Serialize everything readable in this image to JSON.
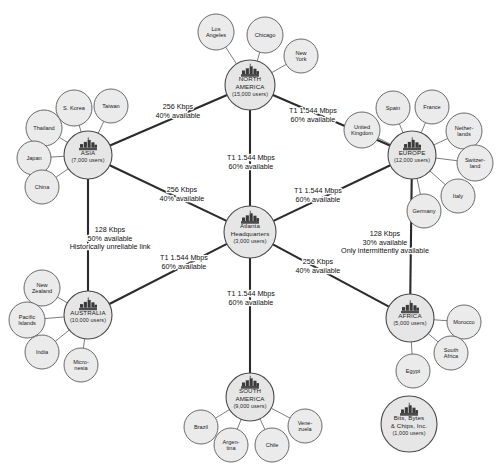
{
  "diagram": {
    "type": "hub-and-spoke-network",
    "colors": {
      "node_fill": "#e6e6e6",
      "node_stroke": "#4a4a4a",
      "backbone_link": "#2b2b2b",
      "spoke_link": "#6d6d6d",
      "text": "#1a1a1a",
      "background": "#ffffff"
    },
    "hub_icon_name": "server-rack-icon"
  },
  "hubs": [
    {
      "id": "atlanta",
      "name_lines": [
        "Atlanta",
        "Headquarters"
      ],
      "users": "(3,000 users)",
      "cx": 250,
      "cy": 232,
      "r": 26,
      "leaves": []
    },
    {
      "id": "north_america",
      "name_lines": [
        "NORTH",
        "AMERICA"
      ],
      "users": "(15,000 users)",
      "cx": 250,
      "cy": 85,
      "r": 25,
      "leaves": [
        {
          "label_lines": [
            "Los",
            "Angeles"
          ],
          "cx": 216,
          "cy": 32,
          "r": 18
        },
        {
          "label_lines": [
            "Chicago"
          ],
          "cx": 265,
          "cy": 35,
          "r": 18
        },
        {
          "label_lines": [
            "New",
            "York"
          ],
          "cx": 301,
          "cy": 56,
          "r": 17
        }
      ]
    },
    {
      "id": "asia",
      "name_lines": [
        "ASIA"
      ],
      "users": "(7,000 users)",
      "cx": 88,
      "cy": 155,
      "r": 24,
      "leaves": [
        {
          "label_lines": [
            "S. Korea"
          ],
          "cx": 74,
          "cy": 108,
          "r": 18
        },
        {
          "label_lines": [
            "Taiwan"
          ],
          "cx": 111,
          "cy": 106,
          "r": 17
        },
        {
          "label_lines": [
            "Thailand"
          ],
          "cx": 44,
          "cy": 128,
          "r": 18
        },
        {
          "label_lines": [
            "Japan"
          ],
          "cx": 34,
          "cy": 158,
          "r": 17
        },
        {
          "label_lines": [
            "China"
          ],
          "cx": 42,
          "cy": 187,
          "r": 17
        }
      ]
    },
    {
      "id": "europe",
      "name_lines": [
        "EUROPE"
      ],
      "users": "(12,000 users)",
      "cx": 412,
      "cy": 155,
      "r": 24,
      "leaves": [
        {
          "label_lines": [
            "Spain"
          ],
          "cx": 393,
          "cy": 108,
          "r": 17
        },
        {
          "label_lines": [
            "France"
          ],
          "cx": 432,
          "cy": 107,
          "r": 17
        },
        {
          "label_lines": [
            "United",
            "Kingdom"
          ],
          "cx": 362,
          "cy": 130,
          "r": 18
        },
        {
          "label_lines": [
            "Nether-",
            "lands"
          ],
          "cx": 464,
          "cy": 131,
          "r": 18
        },
        {
          "label_lines": [
            "Switzer-",
            "land"
          ],
          "cx": 475,
          "cy": 163,
          "r": 18
        },
        {
          "label_lines": [
            "Italy"
          ],
          "cx": 458,
          "cy": 196,
          "r": 17
        },
        {
          "label_lines": [
            "Germany"
          ],
          "cx": 424,
          "cy": 211,
          "r": 17
        }
      ]
    },
    {
      "id": "australia",
      "name_lines": [
        "AUSTRALIA"
      ],
      "users": "(10,000 users)",
      "cx": 88,
      "cy": 315,
      "r": 24,
      "leaves": [
        {
          "label_lines": [
            "New",
            "Zealand"
          ],
          "cx": 42,
          "cy": 288,
          "r": 18
        },
        {
          "label_lines": [
            "Pacific",
            "Islands"
          ],
          "cx": 27,
          "cy": 320,
          "r": 18
        },
        {
          "label_lines": [
            "India"
          ],
          "cx": 42,
          "cy": 352,
          "r": 17
        },
        {
          "label_lines": [
            "Micro-",
            "nesia"
          ],
          "cx": 81,
          "cy": 365,
          "r": 17
        }
      ]
    },
    {
      "id": "africa",
      "name_lines": [
        "AFRICA"
      ],
      "users": "(5,000 users)",
      "cx": 410,
      "cy": 318,
      "r": 24,
      "leaves": [
        {
          "label_lines": [
            "Morocco"
          ],
          "cx": 464,
          "cy": 322,
          "r": 17
        },
        {
          "label_lines": [
            "South",
            "Africa"
          ],
          "cx": 451,
          "cy": 353,
          "r": 17
        },
        {
          "label_lines": [
            "Egypt"
          ],
          "cx": 413,
          "cy": 371,
          "r": 17
        }
      ]
    },
    {
      "id": "south_america",
      "name_lines": [
        "SOUTH",
        "AMERICA"
      ],
      "users": "(9,000 users)",
      "cx": 250,
      "cy": 397,
      "r": 24,
      "leaves": [
        {
          "label_lines": [
            "Brazil"
          ],
          "cx": 201,
          "cy": 427,
          "r": 17
        },
        {
          "label_lines": [
            "Argen-",
            "tina"
          ],
          "cx": 231,
          "cy": 445,
          "r": 17
        },
        {
          "label_lines": [
            "Chile"
          ],
          "cx": 272,
          "cy": 445,
          "r": 17
        },
        {
          "label_lines": [
            "Vene-",
            "zuela"
          ],
          "cx": 305,
          "cy": 426,
          "r": 17
        }
      ]
    },
    {
      "id": "bits_bytes_chips",
      "name_lines": [
        "Bits, Bytes",
        "& Chips, Inc."
      ],
      "users": "(1,000 users)",
      "cx": 409,
      "cy": 424,
      "r": 28,
      "leaves": []
    }
  ],
  "links": [
    {
      "id": "na_asia",
      "from": "north_america",
      "to": "asia",
      "label_lines": [
        "256 Kbps",
        "40% available"
      ],
      "label_x": 178,
      "label_y": 109
    },
    {
      "id": "na_europe",
      "from": "north_america",
      "to": "europe",
      "label_lines": [
        "T1 1.544 Mbps",
        "60% available"
      ],
      "label_x": 313,
      "label_y": 113
    },
    {
      "id": "na_atlanta",
      "from": "north_america",
      "to": "atlanta",
      "label_lines": [
        "T1 1.544 Mbps",
        "60% available"
      ],
      "label_x": 251,
      "label_y": 160
    },
    {
      "id": "asia_atlanta",
      "from": "asia",
      "to": "atlanta",
      "label_lines": [
        "256 Kbps",
        "40% available"
      ],
      "label_x": 182,
      "label_y": 192
    },
    {
      "id": "europe_atlanta",
      "from": "europe",
      "to": "atlanta",
      "label_lines": [
        "T1 1.544 Mbps",
        "60% available"
      ],
      "label_x": 318,
      "label_y": 193
    },
    {
      "id": "asia_australia",
      "from": "asia",
      "to": "australia",
      "label_lines": [
        "128 Kbps",
        "50% available",
        "Historically unreliable link"
      ],
      "label_x": 110,
      "label_y": 232
    },
    {
      "id": "australia_atlanta",
      "from": "australia",
      "to": "atlanta",
      "label_lines": [
        "T1 1.544 Mbps",
        "60% available"
      ],
      "label_x": 184,
      "label_y": 260
    },
    {
      "id": "europe_africa",
      "from": "europe",
      "to": "africa",
      "label_lines": [
        "128 Kbps",
        "30% available",
        "Only intermittently available"
      ],
      "label_x": 385,
      "label_y": 236
    },
    {
      "id": "atlanta_africa",
      "from": "atlanta",
      "to": "africa",
      "label_lines": [
        "256 Kbps",
        "40% available"
      ],
      "label_x": 318,
      "label_y": 264
    },
    {
      "id": "atlanta_south_america",
      "from": "atlanta",
      "to": "south_america",
      "label_lines": [
        "T1 1.544 Mbps",
        "60% available"
      ],
      "label_x": 251,
      "label_y": 296
    }
  ]
}
